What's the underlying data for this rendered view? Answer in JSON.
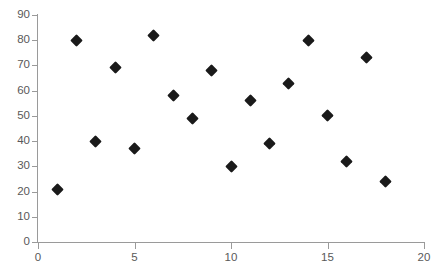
{
  "chart_data": {
    "type": "scatter",
    "title": "",
    "xlabel": "",
    "ylabel": "",
    "xlim": [
      0,
      20
    ],
    "ylim": [
      0,
      90
    ],
    "x_ticks": [
      0,
      5,
      10,
      15,
      20
    ],
    "y_ticks": [
      0,
      10,
      20,
      30,
      40,
      50,
      60,
      70,
      80,
      90
    ],
    "x_tick_labels": [
      "0",
      "5",
      "10",
      "15",
      "20"
    ],
    "y_tick_labels": [
      "0",
      "10",
      "20",
      "30",
      "40",
      "50",
      "60",
      "70",
      "80",
      "90"
    ],
    "grid": false,
    "legend": null,
    "marker_shape": "diamond",
    "marker_color": "#1a1a1a",
    "axis_color": "#9a9a9a",
    "tick_label_color": "#595959",
    "series": [
      {
        "name": "",
        "points": [
          {
            "x": 1,
            "y": 21
          },
          {
            "x": 2,
            "y": 80
          },
          {
            "x": 3,
            "y": 40
          },
          {
            "x": 4,
            "y": 69
          },
          {
            "x": 5,
            "y": 37
          },
          {
            "x": 6,
            "y": 82
          },
          {
            "x": 7,
            "y": 58
          },
          {
            "x": 8,
            "y": 49
          },
          {
            "x": 9,
            "y": 68
          },
          {
            "x": 10,
            "y": 30
          },
          {
            "x": 11,
            "y": 56
          },
          {
            "x": 12,
            "y": 39
          },
          {
            "x": 13,
            "y": 63
          },
          {
            "x": 14,
            "y": 80
          },
          {
            "x": 15,
            "y": 50
          },
          {
            "x": 16,
            "y": 32
          },
          {
            "x": 17,
            "y": 73
          },
          {
            "x": 18,
            "y": 24
          }
        ]
      }
    ]
  }
}
